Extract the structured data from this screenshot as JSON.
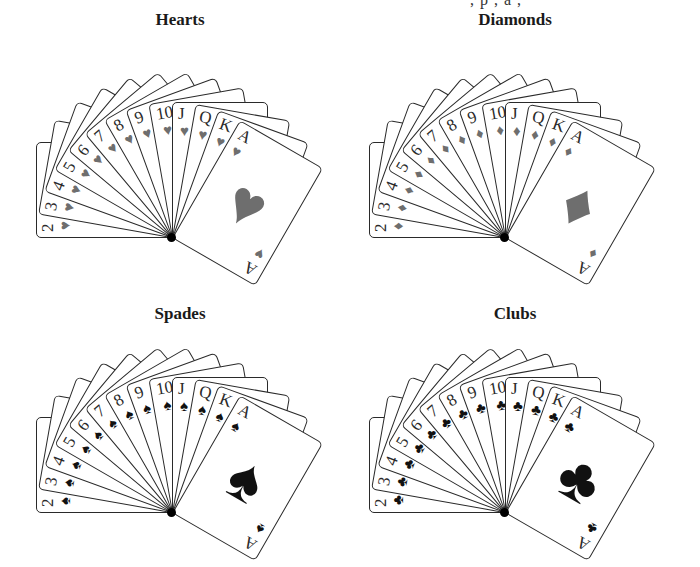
{
  "top_cut_text": ", p    , a ,",
  "ranks": [
    "2",
    "3",
    "4",
    "5",
    "6",
    "7",
    "8",
    "9",
    "10",
    "J",
    "Q",
    "K",
    "A"
  ],
  "panels": [
    {
      "id": "hearts",
      "title": "Hearts",
      "glyph": "♥",
      "color": "#6e6e6e",
      "left": 10,
      "top": 0,
      "pivot": [
        162,
        228
      ]
    },
    {
      "id": "diamonds",
      "title": "Diamonds",
      "glyph": "♦",
      "color": "#6e6e6e",
      "left": 345,
      "top": 0,
      "pivot": [
        160,
        228
      ]
    },
    {
      "id": "spades",
      "title": "Spades",
      "glyph": "♠",
      "color": "#111111",
      "left": 10,
      "top": 300,
      "pivot": [
        162,
        203
      ]
    },
    {
      "id": "clubs",
      "title": "Clubs",
      "glyph": "♣",
      "color": "#111111",
      "left": 345,
      "top": 300,
      "pivot": [
        160,
        203
      ]
    }
  ],
  "fan": {
    "start_angle": -90,
    "step": 10
  }
}
